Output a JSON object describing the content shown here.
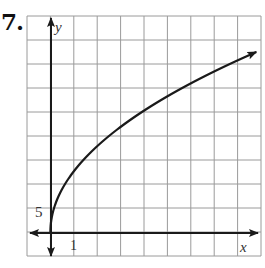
{
  "problem": {
    "number_label": "7."
  },
  "chart_data": {
    "type": "line",
    "title": "",
    "xlabel": "x",
    "ylabel": "y",
    "tick_labels": {
      "x": [
        "1"
      ],
      "y": [
        "5"
      ]
    },
    "x_tick_step": 1,
    "y_tick_step": 5,
    "xlim": [
      -1,
      9
    ],
    "ylim": [
      -5,
      45
    ],
    "grid": true,
    "legend": null,
    "axes_arrows": true,
    "series": [
      {
        "name": "curve",
        "description": "square-root shaped curve starting at origin, arrow at right end",
        "x": [
          0,
          0.17,
          0.9,
          1.65,
          2.95,
          4.5,
          6.0,
          8.8
        ],
        "y": [
          0,
          5.4,
          11,
          16,
          21,
          26,
          30.5,
          37.5
        ]
      }
    ]
  },
  "colors": {
    "grid": "#9a9a9a",
    "axis": "#1a1a1a",
    "curve": "#1a1a1a",
    "background": "#ffffff"
  }
}
